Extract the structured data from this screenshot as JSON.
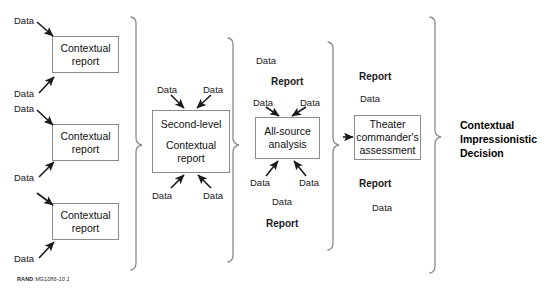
{
  "figure": {
    "credit_prefix": "RAND",
    "credit_id": "MG1086-10.1",
    "stroke_color": "#8c8c8c",
    "arrow_color": "#1a1a1a",
    "text_color": "#1a1a1a"
  },
  "nodes": [
    {
      "id": "contextual-report-1",
      "line1": "Contextual",
      "line2": "report",
      "line3": ""
    },
    {
      "id": "contextual-report-2",
      "line1": "Contextual",
      "line2": "report",
      "line3": ""
    },
    {
      "id": "contextual-report-3",
      "line1": "Contextual",
      "line2": "report",
      "line3": ""
    },
    {
      "id": "second-level-contextual-report",
      "line1": "Second-level",
      "line2": "Contextual",
      "line3": "report"
    },
    {
      "id": "all-source-analysis",
      "line1": "All-source",
      "line2": "analysis",
      "line3": ""
    },
    {
      "id": "theater-commanders-assessment",
      "line1": "Theater",
      "line2": "commander's",
      "line3": "assessment"
    }
  ],
  "labels": {
    "data": "Data",
    "report": "Report"
  },
  "column1_labels": [
    {
      "id": "c1-data-1",
      "text": "Data"
    },
    {
      "id": "c1-data-2",
      "text": "Data"
    },
    {
      "id": "c1-data-3",
      "text": "Data"
    },
    {
      "id": "c1-data-4",
      "text": "Data"
    },
    {
      "id": "c1-data-5",
      "text": "Data"
    }
  ],
  "column2_labels": [
    {
      "id": "c2-data-top-left",
      "text": "Data"
    },
    {
      "id": "c2-data-top-right",
      "text": "Data"
    },
    {
      "id": "c2-data-bottom-left",
      "text": "Data"
    },
    {
      "id": "c2-data-bottom-right",
      "text": "Data"
    }
  ],
  "column3_labels": [
    {
      "id": "c3-data-top",
      "text": "Data"
    },
    {
      "id": "c3-report-top",
      "text": "Report"
    },
    {
      "id": "c3-data-in-left",
      "text": "Data"
    },
    {
      "id": "c3-data-in-right",
      "text": "Data"
    },
    {
      "id": "c3-data-out-left",
      "text": "Data"
    },
    {
      "id": "c3-data-out-right",
      "text": "Data"
    },
    {
      "id": "c3-data-bottom",
      "text": "Data"
    },
    {
      "id": "c3-report-bottom",
      "text": "Report"
    }
  ],
  "column4_labels": [
    {
      "id": "c4-report-top",
      "text": "Report"
    },
    {
      "id": "c4-data-top",
      "text": "Data"
    },
    {
      "id": "c4-report-bottom",
      "text": "Report"
    },
    {
      "id": "c4-data-bottom",
      "text": "Data"
    }
  ],
  "final_output": {
    "line1": "Contextual",
    "line2": "Impressionistic",
    "line3": "Decision"
  }
}
